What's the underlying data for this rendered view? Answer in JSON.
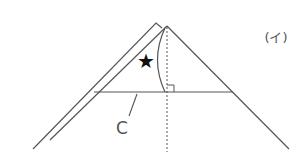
{
  "diagram": {
    "figure_label": "(イ)",
    "segment_label": "C",
    "marker_symbol": "★",
    "colors": {
      "line": "#555555",
      "star": "#111111",
      "background": "#ffffff"
    },
    "elements": {
      "outer_fold_edge": "left folded edge of paper",
      "inner_triangle": "folded triangle with apex at top",
      "base_segment": "horizontal segment C",
      "axis": "dotted vertical symmetry line",
      "arc": "curved fold line from apex to base",
      "right_angle": "right-angle marker at intersection of axis and base"
    }
  }
}
